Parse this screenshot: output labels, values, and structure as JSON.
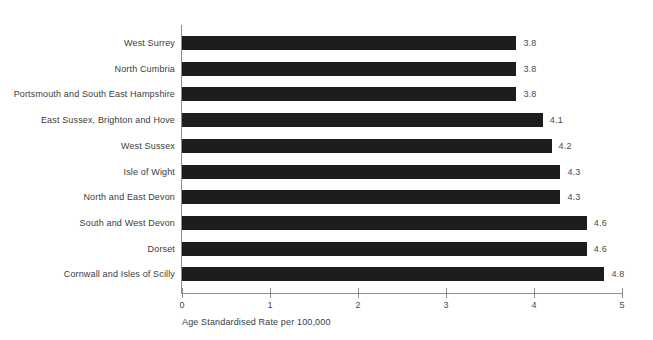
{
  "chart_data": {
    "type": "bar",
    "orientation": "horizontal",
    "title": "",
    "xlabel": "Age Standardised Rate per 100,000",
    "ylabel": "",
    "xlim": [
      0,
      5
    ],
    "xticks": [
      "0",
      "1",
      "2",
      "3",
      "4",
      "5"
    ],
    "grid": false,
    "legend": null,
    "categories": [
      "West Surrey",
      "North Cumbria",
      "Portsmouth and South East Hampshire",
      "East Sussex, Brighton and Hove",
      "West Sussex",
      "Isle of Wight",
      "North and East Devon",
      "South and West Devon",
      "Dorset",
      "Cornwall and Isles of Scilly"
    ],
    "values": [
      3.8,
      3.8,
      3.8,
      4.1,
      4.2,
      4.3,
      4.3,
      4.6,
      4.6,
      4.8
    ],
    "value_labels": [
      "3.8",
      "3.8",
      "3.8",
      "4.1",
      "4.2",
      "4.3",
      "4.3",
      "4.6",
      "4.6",
      "4.8"
    ],
    "bar_color": "#1d1d1d",
    "axis_color": "#8e8e8e",
    "background": "#ffffff"
  }
}
